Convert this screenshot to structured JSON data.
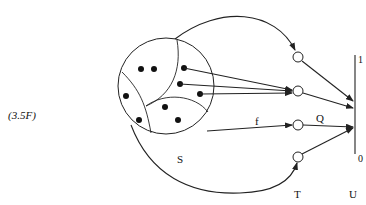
{
  "figure": {
    "equation_label": "(3.5F)",
    "set_label": "S",
    "map_label": "f",
    "function_label": "Q",
    "nodes_label": "T",
    "interval_label": "U",
    "interval_top": "1",
    "interval_bottom": "0"
  },
  "colors": {
    "stroke": "#222222",
    "background": "#ffffff"
  }
}
